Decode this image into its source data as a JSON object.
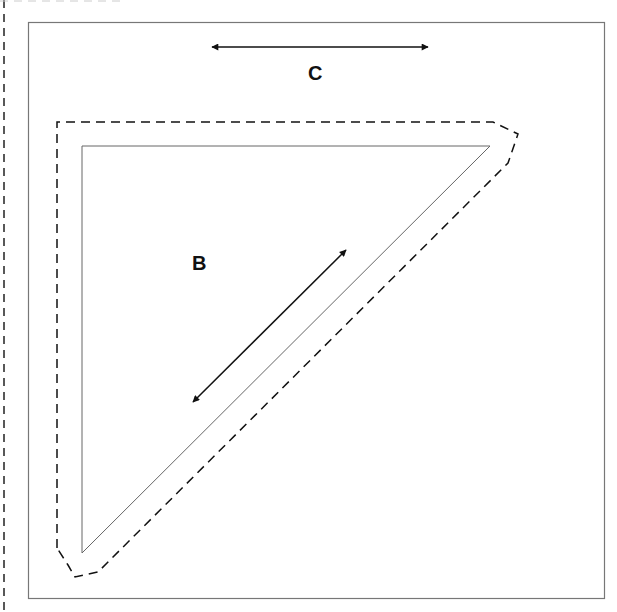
{
  "diagram": {
    "labels": {
      "c": "C",
      "b": "B"
    },
    "colors": {
      "background": "#ffffff",
      "frame": "#777777",
      "triangle": "#666666",
      "dashed": "#111111",
      "arrow": "#111111"
    }
  }
}
